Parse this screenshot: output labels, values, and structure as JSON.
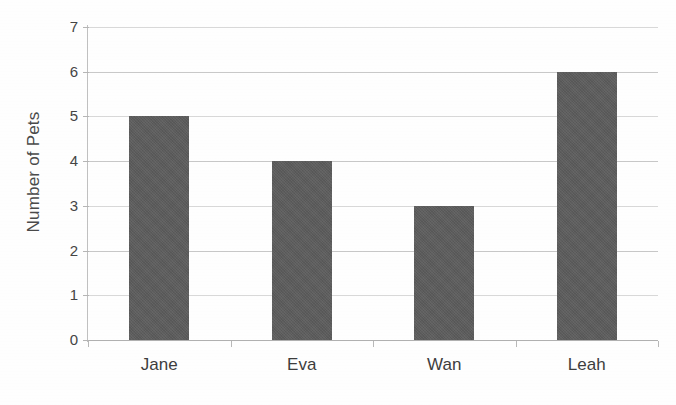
{
  "chart_data": {
    "type": "bar",
    "title": "",
    "xlabel": "",
    "ylabel": "Number of Pets",
    "categories": [
      "Jane",
      "Eva",
      "Wan",
      "Leah"
    ],
    "values": [
      5,
      4,
      3,
      6
    ],
    "series": [
      {
        "name": "Number of Pets",
        "values": [
          5,
          4,
          3,
          6
        ]
      }
    ],
    "ylim": [
      0,
      7
    ],
    "ytick_labels": [
      "0",
      "1",
      "2",
      "3",
      "4",
      "5",
      "6",
      "7"
    ],
    "ytick_values": [
      0,
      1,
      2,
      3,
      4,
      5,
      6,
      7
    ],
    "grid": true,
    "grid_axis": "y",
    "legend": false,
    "legend_position": "none",
    "bar_color": "#5c5c5c",
    "gridline_color": "#c8c8c8",
    "axis_color": "#b5b5b5",
    "background_color": "#ffffff"
  },
  "axes": {
    "y_title": "Number of Pets"
  }
}
